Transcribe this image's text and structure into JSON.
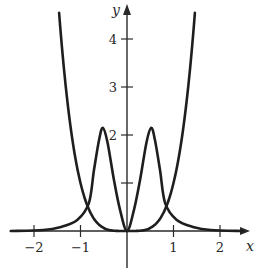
{
  "chart_data": {
    "type": "line",
    "title": "",
    "xlabel": "x",
    "ylabel": "y",
    "xlim": [
      -2.5,
      2.6
    ],
    "ylim": [
      -0.8,
      4.7
    ],
    "grid": false,
    "legend": null,
    "x_ticks": [
      -2,
      -1,
      1,
      2
    ],
    "x_tick_labels": [
      "−2",
      "−1",
      "1",
      "2"
    ],
    "y_ticks": [
      1,
      2,
      3,
      4
    ],
    "y_tick_labels": [
      "",
      "2",
      "3",
      "4"
    ],
    "series": [
      {
        "name": "quartic curve (y = x^4)",
        "points": [
          [
            -1.46,
            4.54
          ],
          [
            -1.3,
            2.86
          ],
          [
            -1.1,
            1.46
          ],
          [
            -0.9,
            0.66
          ],
          [
            -0.7,
            0.24
          ],
          [
            -0.5,
            0.06
          ],
          [
            -0.3,
            0.01
          ],
          [
            0,
            0
          ],
          [
            0.3,
            0.01
          ],
          [
            0.5,
            0.06
          ],
          [
            0.7,
            0.24
          ],
          [
            0.9,
            0.66
          ],
          [
            1.1,
            1.46
          ],
          [
            1.3,
            2.86
          ],
          [
            1.46,
            4.54
          ]
        ]
      },
      {
        "name": "double-peak curve",
        "points": [
          [
            -2.5,
            0.0
          ],
          [
            -1.8,
            0.02
          ],
          [
            -1.44,
            0.08
          ],
          [
            -1.07,
            0.23
          ],
          [
            -0.82,
            0.58
          ],
          [
            -0.71,
            1.27
          ],
          [
            -0.6,
            1.9
          ],
          [
            -0.52,
            2.15
          ],
          [
            -0.42,
            1.85
          ],
          [
            -0.28,
            1.06
          ],
          [
            -0.15,
            0.44
          ],
          [
            0,
            0
          ],
          [
            0.15,
            0.44
          ],
          [
            0.28,
            1.06
          ],
          [
            0.42,
            1.85
          ],
          [
            0.52,
            2.15
          ],
          [
            0.6,
            1.9
          ],
          [
            0.71,
            1.27
          ],
          [
            0.82,
            0.58
          ],
          [
            1.07,
            0.23
          ],
          [
            1.44,
            0.08
          ],
          [
            1.8,
            0.02
          ],
          [
            2.5,
            0.0
          ]
        ]
      }
    ],
    "annotations": [
      "Curves intersect at approximately x = ±0.84, y = 0.5",
      "Peaks at x = ±0.5, y ≈ 2.15"
    ]
  }
}
